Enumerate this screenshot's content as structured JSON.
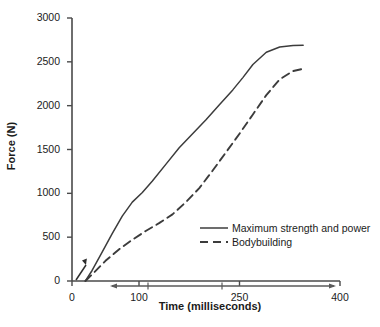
{
  "chart_data": {
    "type": "line",
    "title": "",
    "xlabel": "Time (milliseconds)",
    "ylabel": "Force (N)",
    "xlim": [
      0,
      400
    ],
    "ylim": [
      0,
      3000
    ],
    "grid": false,
    "legend_position": "inside-lower-right",
    "xticks": [
      0,
      100,
      250,
      400
    ],
    "xtick_labels": [
      "0",
      "100",
      "250",
      "400"
    ],
    "yticks": [
      0,
      500,
      1000,
      1500,
      2000,
      2500,
      3000
    ],
    "ytick_labels": [
      "0",
      "500",
      "1000",
      "1500",
      "2000",
      "2500",
      "3000"
    ],
    "series": [
      {
        "name": "Maximum strength and power",
        "style": "solid",
        "color": "#3c3c3c",
        "x": [
          20,
          30,
          45,
          60,
          75,
          90,
          105,
          120,
          140,
          160,
          180,
          200,
          220,
          240,
          255,
          270,
          290,
          310,
          330,
          345
        ],
        "y": [
          0,
          120,
          330,
          540,
          740,
          900,
          1010,
          1140,
          1330,
          1520,
          1680,
          1840,
          2010,
          2180,
          2320,
          2470,
          2610,
          2670,
          2685,
          2690
        ]
      },
      {
        "name": "Bodybuilding",
        "style": "dashed",
        "color": "#3c3c3c",
        "x": [
          20,
          32,
          50,
          70,
          90,
          110,
          130,
          150,
          170,
          190,
          210,
          230,
          250,
          270,
          290,
          310,
          330,
          345
        ],
        "y": [
          0,
          90,
          230,
          360,
          470,
          570,
          660,
          760,
          900,
          1060,
          1260,
          1470,
          1680,
          1900,
          2120,
          2300,
          2395,
          2420
        ]
      }
    ],
    "annotations": [
      {
        "name": "origin-pointer-arrow",
        "type": "arrow",
        "description": "small diagonal arrow near origin"
      },
      {
        "name": "time-range-double-arrow",
        "type": "double-arrow",
        "description": "horizontal double-headed arrow beneath x-axis"
      }
    ]
  },
  "legend": {
    "entries": [
      {
        "label": "Maximum strength and power",
        "style": "solid"
      },
      {
        "label": "Bodybuilding",
        "style": "dashed"
      }
    ]
  }
}
